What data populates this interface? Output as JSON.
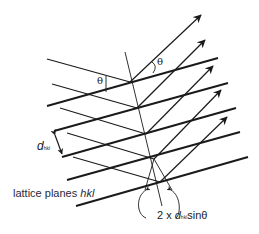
{
  "diagram": {
    "labels": {
      "theta_incident": "θ",
      "theta_reflected": "θ",
      "d_symbol": "d",
      "d_subscript": "hkl",
      "planes_prefix": "lattice planes ",
      "planes_hkl": "hkl",
      "formula_prefix": "2 x ",
      "formula_d": "d",
      "formula_sub": "hkl",
      "formula_suffix": "sinθ"
    },
    "elements": {
      "lattice_planes": 5,
      "incident_rays": 4,
      "reflected_rays": 4,
      "normal_line": 1
    },
    "colors": {
      "line": "#1a1a1a",
      "text": "#222222"
    }
  }
}
